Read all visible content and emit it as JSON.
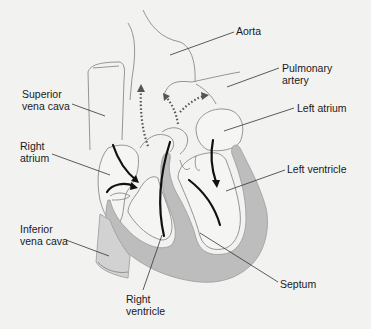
{
  "diagram": {
    "title": "",
    "colors": {
      "background": "#f2f2f0",
      "muscle_wall": "#bdbdbd",
      "outline": "#8a8a8a",
      "flow_arrow": "#111111",
      "oxygenated_flow_dotted": "#555555",
      "label_text": "#1a1a1a"
    },
    "labels": [
      {
        "id": "aorta",
        "text": "Aorta",
        "x": 236,
        "y": 25,
        "leader": {
          "x1": 234,
          "y1": 32,
          "x2": 170,
          "y2": 55
        }
      },
      {
        "id": "pulmonary-artery",
        "text": "Pulmonary\nartery",
        "x": 282,
        "y": 62,
        "leader": {
          "x1": 279,
          "y1": 68,
          "x2": 227,
          "y2": 87
        }
      },
      {
        "id": "superior-vena-cava",
        "text": "Superior\nvena cava",
        "x": 22,
        "y": 88,
        "leader": {
          "x1": 72,
          "y1": 104,
          "x2": 105,
          "y2": 116
        }
      },
      {
        "id": "left-atrium",
        "text": "Left atrium",
        "x": 297,
        "y": 102,
        "leader": {
          "x1": 294,
          "y1": 108,
          "x2": 224,
          "y2": 131
        }
      },
      {
        "id": "right-atrium",
        "text": "Right\natrium",
        "x": 20,
        "y": 140,
        "leader": {
          "x1": 52,
          "y1": 154,
          "x2": 110,
          "y2": 175
        }
      },
      {
        "id": "left-ventricle",
        "text": "Left ventricle",
        "x": 287,
        "y": 163,
        "leader": {
          "x1": 285,
          "y1": 170,
          "x2": 226,
          "y2": 191
        }
      },
      {
        "id": "inferior-vena-cava",
        "text": "Inferior\nvena cava",
        "x": 20,
        "y": 223,
        "leader": {
          "x1": 66,
          "y1": 240,
          "x2": 109,
          "y2": 256
        }
      },
      {
        "id": "septum",
        "text": "Septum",
        "x": 280,
        "y": 278,
        "leader": {
          "x1": 278,
          "y1": 282,
          "x2": 200,
          "y2": 233
        }
      },
      {
        "id": "right-ventricle",
        "text": "Right\nventricle",
        "x": 126,
        "y": 293,
        "leader": {
          "x1": 143,
          "y1": 290,
          "x2": 162,
          "y2": 235
        }
      }
    ]
  }
}
